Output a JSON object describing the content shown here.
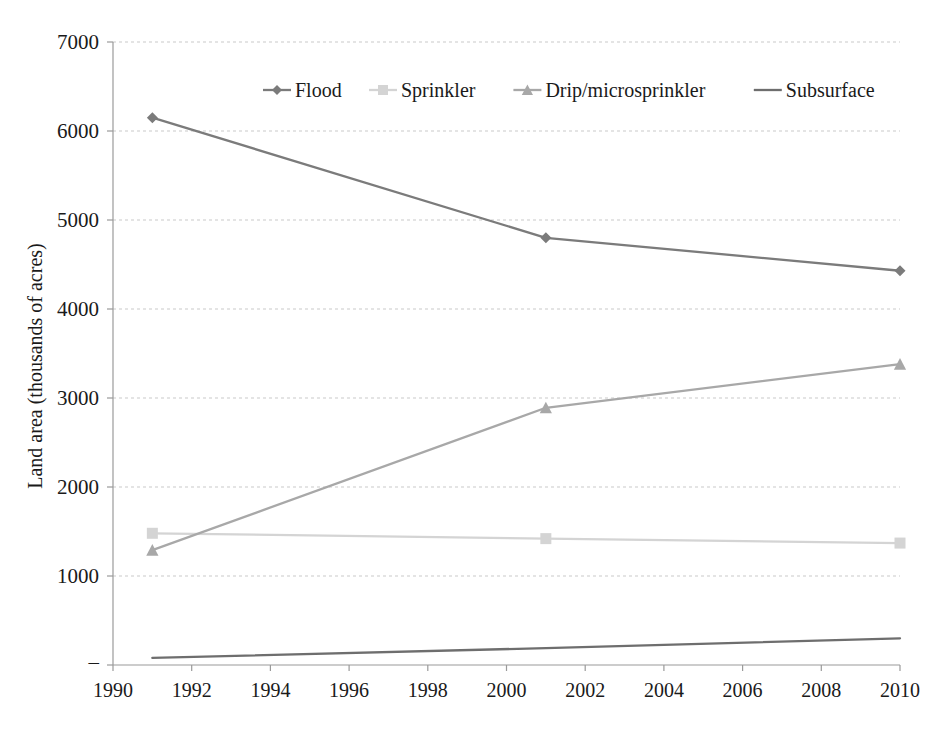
{
  "chart_data": {
    "type": "line",
    "title": "",
    "xlabel": "",
    "ylabel": "Land area (thousands of acres)",
    "xlim": [
      1990,
      2010
    ],
    "ylim": [
      0,
      7000
    ],
    "grid": true,
    "legend_position": "top-center",
    "x_ticks": [
      "1990",
      "1992",
      "1994",
      "1996",
      "1998",
      "2000",
      "2002",
      "2004",
      "2006",
      "2008",
      "2010"
    ],
    "x_tick_values": [
      1990,
      1992,
      1994,
      1996,
      1998,
      2000,
      2002,
      2004,
      2006,
      2008,
      2010
    ],
    "y_ticks": [
      "–",
      "1000",
      "2000",
      "3000",
      "4000",
      "5000",
      "6000",
      "7000"
    ],
    "y_tick_values": [
      0,
      1000,
      2000,
      3000,
      4000,
      5000,
      6000,
      7000
    ],
    "x": [
      1991,
      2001,
      2010
    ],
    "series": [
      {
        "name": "Flood",
        "marker": "diamond",
        "color": "#7b7b7b",
        "values": [
          6150,
          4800,
          4430
        ]
      },
      {
        "name": "Sprinkler",
        "marker": "square",
        "color": "#d4d4d4",
        "values": [
          1480,
          1420,
          1370
        ]
      },
      {
        "name": "Drip/microsprinkler",
        "marker": "triangle",
        "color": "#a8a8a8",
        "values": [
          1290,
          2890,
          3380
        ]
      },
      {
        "name": "Subsurface",
        "marker": "none",
        "color": "#6e6e6e",
        "values": [
          80,
          190,
          300
        ]
      }
    ]
  },
  "axes": {
    "y_title": "Land area (thousands of acres)"
  },
  "legend": {
    "items": [
      {
        "label": "Flood"
      },
      {
        "label": "Sprinkler"
      },
      {
        "label": "Drip/microsprinkler"
      },
      {
        "label": "Subsurface"
      }
    ]
  },
  "colors": {
    "gridline": "#c9c9c9",
    "axis": "#9a9a9a",
    "text": "#1a1a1a",
    "background": "#ffffff"
  }
}
